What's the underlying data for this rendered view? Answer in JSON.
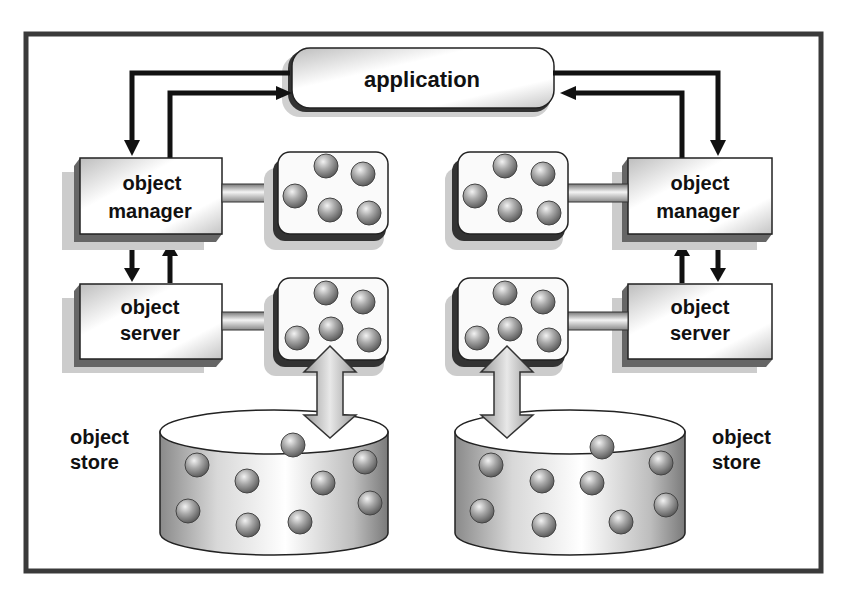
{
  "diagram": {
    "application": {
      "label": "application"
    },
    "left": {
      "manager": {
        "line1": "object",
        "line2": "manager"
      },
      "server": {
        "line1": "object",
        "line2": "server"
      },
      "store": {
        "line1": "object",
        "line2": "store"
      }
    },
    "right": {
      "manager": {
        "line1": "object",
        "line2": "manager"
      },
      "server": {
        "line1": "object",
        "line2": "server"
      },
      "store": {
        "line1": "object",
        "line2": "store"
      }
    }
  },
  "colors": {
    "frame": "#3a3a3a",
    "arrow": "#111111",
    "box_fill": "#f2f2f2",
    "sphere": "#9a9a9a",
    "store_arrow": "#a8a8a8"
  }
}
